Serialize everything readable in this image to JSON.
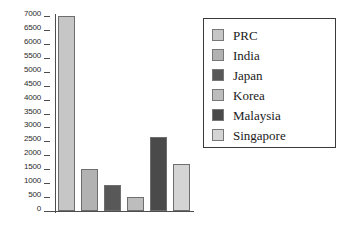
{
  "chart_data": {
    "type": "bar",
    "title": "",
    "xlabel": "",
    "ylabel": "",
    "categories": [
      "PRC",
      "India",
      "Japan",
      "Korea",
      "Malaysia",
      "Singapore"
    ],
    "values": [
      7010,
      1500,
      950,
      515,
      2640,
      1700
    ],
    "colors": [
      "#c6c6c6",
      "#b2b2b2",
      "#585858",
      "#bdbdbd",
      "#4a4a4a",
      "#d4d4d4"
    ],
    "ylim": [
      0,
      7000
    ],
    "ytick_step": 500,
    "ytick_labels": [
      "0",
      "500",
      "1000",
      "1500",
      "2000",
      "2500",
      "3000",
      "3500",
      "4000",
      "4500",
      "5000",
      "5500",
      "6000",
      "6500",
      "7000"
    ],
    "ytick_values": [
      0,
      500,
      1000,
      1500,
      2000,
      2500,
      3000,
      3500,
      4000,
      4500,
      5000,
      5500,
      6000,
      6500,
      7000
    ],
    "xtick_labels": [],
    "grid": false,
    "legend": {
      "position": "right",
      "entries": [
        {
          "label": "PRC",
          "color": "#c6c6c6"
        },
        {
          "label": "India",
          "color": "#b2b2b2"
        },
        {
          "label": "Japan",
          "color": "#585858"
        },
        {
          "label": "Korea",
          "color": "#bdbdbd"
        },
        {
          "label": "Malaysia",
          "color": "#4a4a4a"
        },
        {
          "label": "Singapore",
          "color": "#d4d4d4"
        }
      ]
    }
  }
}
